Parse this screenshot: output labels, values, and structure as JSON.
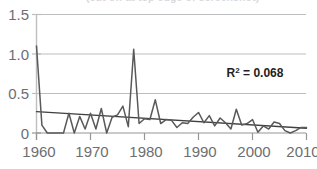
{
  "chart": {
    "title_partial": "(cut off at top edge of screenshot)",
    "annotation": {
      "r2_prefix": "R",
      "r2_sup": "2",
      "r2_value": " = 0.068"
    },
    "axes": {
      "y_ticks": [
        "0",
        "0.5",
        "1.0",
        "1.5"
      ],
      "x_ticks": [
        "1960",
        "1970",
        "1980",
        "1990",
        "2000",
        "2010"
      ]
    },
    "colors": {
      "series_line": "#58595b",
      "trend_line": "#414042",
      "grid": "#bcbec0",
      "axis_text": "#6d6e71",
      "annotation_text": "#231f20",
      "background": "#ffffff"
    }
  },
  "chart_data": {
    "type": "line",
    "title": "",
    "xlabel": "",
    "ylabel": "",
    "xlim": [
      1960,
      2010
    ],
    "ylim": [
      0,
      1.5
    ],
    "ytick_values": [
      0,
      0.5,
      1.0,
      1.5
    ],
    "xtick_values": [
      1960,
      1970,
      1980,
      1990,
      2000,
      2010
    ],
    "grid": true,
    "legend": false,
    "annotations": [
      {
        "text": "R² = 0.068",
        "x": 1998,
        "y": 0.8
      }
    ],
    "series": [
      {
        "name": "annual value",
        "x": [
          1960,
          1961,
          1962,
          1963,
          1964,
          1965,
          1966,
          1967,
          1968,
          1969,
          1970,
          1971,
          1972,
          1973,
          1974,
          1975,
          1976,
          1977,
          1978,
          1979,
          1980,
          1981,
          1982,
          1983,
          1984,
          1985,
          1986,
          1987,
          1988,
          1989,
          1990,
          1991,
          1992,
          1993,
          1994,
          1995,
          1996,
          1997,
          1998,
          1999,
          2000,
          2001,
          2002,
          2003,
          2004,
          2005,
          2006,
          2007,
          2008,
          2009,
          2010
        ],
        "values": [
          1.1,
          0.1,
          0.0,
          0.0,
          0.0,
          0.0,
          0.25,
          0.0,
          0.21,
          0.05,
          0.25,
          0.05,
          0.31,
          0.0,
          0.2,
          0.23,
          0.34,
          0.08,
          1.06,
          0.12,
          0.18,
          0.17,
          0.42,
          0.12,
          0.17,
          0.16,
          0.07,
          0.13,
          0.12,
          0.2,
          0.26,
          0.13,
          0.22,
          0.09,
          0.19,
          0.13,
          0.05,
          0.3,
          0.1,
          0.12,
          0.17,
          0.01,
          0.09,
          0.05,
          0.14,
          0.12,
          0.03,
          0.0,
          0.03,
          0.07,
          0.07
        ]
      },
      {
        "name": "linear trend",
        "x": [
          1960,
          2010
        ],
        "values": [
          0.27,
          0.06
        ],
        "style": "trend"
      }
    ]
  }
}
